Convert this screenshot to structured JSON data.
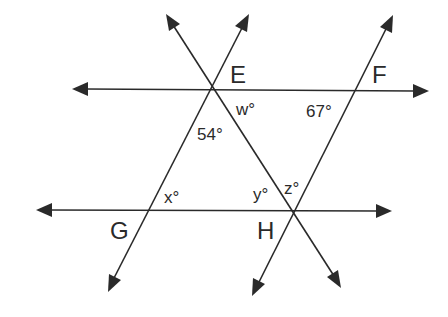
{
  "diagram": {
    "type": "geometry",
    "colors": {
      "stroke": "#2a2a2a",
      "background": "#ffffff"
    },
    "points": {
      "E": {
        "label": "E"
      },
      "F": {
        "label": "F"
      },
      "G": {
        "label": "G"
      },
      "H": {
        "label": "H"
      }
    },
    "angles": {
      "w": {
        "label": "w°",
        "variable": "w"
      },
      "given_54": {
        "label": "54°",
        "value": 54
      },
      "given_67": {
        "label": "67°",
        "value": 67
      },
      "x": {
        "label": "x°",
        "variable": "x"
      },
      "y": {
        "label": "y°",
        "variable": "y"
      },
      "z": {
        "label": "z°",
        "variable": "z"
      }
    },
    "lines": [
      {
        "name": "line-EF",
        "through": [
          "E",
          "F"
        ],
        "kind": "horizontal, arrows both ends"
      },
      {
        "name": "line-GH",
        "through": [
          "G",
          "H"
        ],
        "kind": "horizontal, arrows both ends"
      },
      {
        "name": "line-GE",
        "through": [
          "G",
          "E"
        ],
        "kind": "transversal, arrows both ends"
      },
      {
        "name": "line-EH",
        "through": [
          "E",
          "H"
        ],
        "kind": "transversal, arrows both ends"
      },
      {
        "name": "line-HF",
        "through": [
          "H",
          "F"
        ],
        "kind": "transversal, arrows both ends"
      }
    ]
  }
}
